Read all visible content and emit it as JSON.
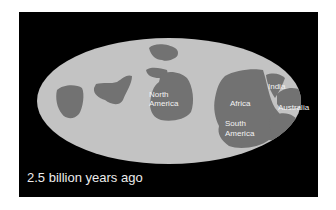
{
  "caption": "2.5 billion years ago",
  "labels": {
    "north_america_1": "North",
    "north_america_2": "America",
    "africa": "Africa",
    "south_america_1": "South",
    "south_america_2": "America",
    "india": "India",
    "australia": "Australia"
  },
  "colors": {
    "background": "#000000",
    "ocean": "#c3c3c3",
    "land": "#727272",
    "label": "#f2f2f2"
  }
}
